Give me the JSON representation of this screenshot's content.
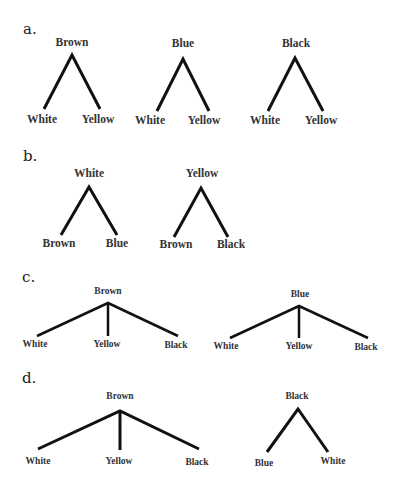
{
  "panels": [
    {
      "label": "a.",
      "trees": [
        {
          "root": "Brown",
          "children": [
            "White",
            "Yellow"
          ]
        },
        {
          "root": "Blue",
          "children": [
            "White",
            "Yellow"
          ]
        },
        {
          "root": "Black",
          "children": [
            "White",
            "Yellow"
          ]
        }
      ]
    },
    {
      "label": "b.",
      "trees": [
        {
          "root": "White",
          "children": [
            "Brown",
            "Blue"
          ]
        },
        {
          "root": "Yellow",
          "children": [
            "Brown",
            "Black"
          ]
        }
      ]
    },
    {
      "label": "c.",
      "trees": [
        {
          "root": "Brown",
          "children": [
            "White",
            "Yellow",
            "Black"
          ]
        },
        {
          "root": "Blue",
          "children": [
            "White",
            "Yellow",
            "Black"
          ]
        }
      ]
    },
    {
      "label": "d.",
      "trees": [
        {
          "root": "Brown",
          "children": [
            "White",
            "Yellow",
            "Black"
          ]
        },
        {
          "root": "Black",
          "children": [
            "Blue",
            "White"
          ]
        }
      ]
    }
  ],
  "colors": {
    "line": "#111111",
    "text": "#333333",
    "background": "#ffffff"
  }
}
